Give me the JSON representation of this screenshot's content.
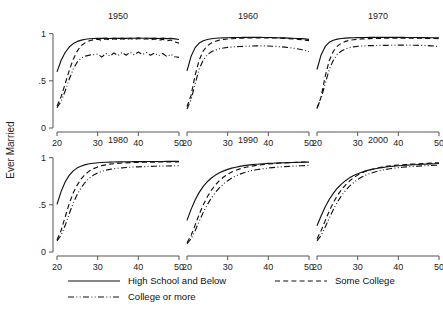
{
  "chart_data": {
    "type": "line",
    "title": "",
    "xlabel": "",
    "ylabel": "Ever Married",
    "xlim": [
      20,
      50
    ],
    "ylim": [
      0,
      1.06
    ],
    "xticks": [
      20,
      30,
      40,
      50
    ],
    "xtick_labels": [
      "20",
      "30",
      "40",
      "50"
    ],
    "yticks": [
      0,
      0.5,
      1
    ],
    "ytick_labels": [
      "0",
      ".5",
      "1"
    ],
    "grid": false,
    "legend_position": "bottom",
    "layout": "2 rows x 3 columns small multiples",
    "panel_titles": [
      "1950",
      "1960",
      "1970",
      "1980",
      "1990",
      "2000"
    ],
    "series_names": [
      "High School and Below",
      "Some College",
      "College or more"
    ],
    "series_styles": [
      "solid",
      "dashed",
      "dash-dot-dot"
    ],
    "x": [
      20,
      21,
      22,
      23,
      24,
      25,
      26,
      27,
      28,
      29,
      30,
      31,
      32,
      33,
      34,
      35,
      36,
      37,
      38,
      39,
      40,
      41,
      42,
      43,
      44,
      45,
      46,
      47,
      48,
      49,
      50
    ],
    "panels": [
      {
        "title": "1950",
        "series": [
          {
            "name": "High School and Below",
            "style": "solid",
            "values": [
              0.595,
              0.715,
              0.8,
              0.858,
              0.895,
              0.918,
              0.932,
              0.941,
              0.946,
              0.949,
              0.951,
              0.95,
              0.952,
              0.949,
              0.952,
              0.95,
              0.953,
              0.95,
              0.954,
              0.951,
              0.955,
              0.951,
              0.954,
              0.95,
              0.953,
              0.949,
              0.952,
              0.948,
              0.95,
              0.944,
              0.938
            ]
          },
          {
            "name": "Some College",
            "style": "dashed",
            "values": [
              0.232,
              0.33,
              0.468,
              0.608,
              0.73,
              0.818,
              0.874,
              0.906,
              0.925,
              0.936,
              0.941,
              0.93,
              0.944,
              0.933,
              0.946,
              0.934,
              0.947,
              0.936,
              0.949,
              0.938,
              0.95,
              0.938,
              0.946,
              0.934,
              0.944,
              0.93,
              0.94,
              0.924,
              0.932,
              0.912,
              0.9
            ]
          },
          {
            "name": "College or more",
            "style": "dash-dot-dot",
            "values": [
              0.215,
              0.283,
              0.392,
              0.516,
              0.626,
              0.7,
              0.742,
              0.762,
              0.773,
              0.778,
              0.783,
              0.752,
              0.79,
              0.762,
              0.795,
              0.768,
              0.8,
              0.772,
              0.803,
              0.776,
              0.805,
              0.778,
              0.8,
              0.772,
              0.796,
              0.766,
              0.79,
              0.758,
              0.782,
              0.755,
              0.748
            ]
          }
        ]
      },
      {
        "title": "1960",
        "series": [
          {
            "name": "High School and Below",
            "style": "solid",
            "values": [
              0.605,
              0.76,
              0.852,
              0.9,
              0.925,
              0.938,
              0.946,
              0.951,
              0.954,
              0.956,
              0.957,
              0.958,
              0.959,
              0.959,
              0.96,
              0.96,
              0.96,
              0.96,
              0.96,
              0.959,
              0.959,
              0.958,
              0.957,
              0.956,
              0.955,
              0.953,
              0.951,
              0.949,
              0.947,
              0.944,
              0.94
            ]
          },
          {
            "name": "Some College",
            "style": "dashed",
            "values": [
              0.225,
              0.345,
              0.56,
              0.72,
              0.818,
              0.872,
              0.902,
              0.92,
              0.931,
              0.938,
              0.943,
              0.946,
              0.949,
              0.951,
              0.953,
              0.954,
              0.955,
              0.956,
              0.956,
              0.956,
              0.956,
              0.955,
              0.954,
              0.952,
              0.95,
              0.948,
              0.945,
              0.941,
              0.937,
              0.932,
              0.926
            ]
          },
          {
            "name": "College or more",
            "style": "dash-dot-dot",
            "values": [
              0.2,
              0.3,
              0.47,
              0.625,
              0.72,
              0.776,
              0.808,
              0.827,
              0.84,
              0.848,
              0.854,
              0.858,
              0.862,
              0.864,
              0.866,
              0.868,
              0.869,
              0.87,
              0.87,
              0.87,
              0.869,
              0.867,
              0.865,
              0.862,
              0.858,
              0.853,
              0.847,
              0.84,
              0.832,
              0.822,
              0.81
            ]
          }
        ]
      },
      {
        "title": "1970",
        "series": [
          {
            "name": "High School and Below",
            "style": "solid",
            "values": [
              0.62,
              0.775,
              0.862,
              0.908,
              0.93,
              0.942,
              0.949,
              0.953,
              0.956,
              0.957,
              0.958,
              0.959,
              0.959,
              0.96,
              0.96,
              0.96,
              0.96,
              0.96,
              0.96,
              0.96,
              0.96,
              0.96,
              0.959,
              0.959,
              0.959,
              0.958,
              0.958,
              0.958,
              0.957,
              0.957,
              0.956
            ]
          },
          {
            "name": "Some College",
            "style": "dashed",
            "values": [
              0.205,
              0.33,
              0.545,
              0.712,
              0.812,
              0.868,
              0.9,
              0.918,
              0.929,
              0.936,
              0.941,
              0.944,
              0.946,
              0.948,
              0.949,
              0.95,
              0.951,
              0.951,
              0.951,
              0.952,
              0.952,
              0.952,
              0.952,
              0.952,
              0.951,
              0.951,
              0.951,
              0.95,
              0.95,
              0.949,
              0.948
            ]
          },
          {
            "name": "College or more",
            "style": "dash-dot-dot",
            "values": [
              0.215,
              0.31,
              0.47,
              0.618,
              0.718,
              0.78,
              0.816,
              0.838,
              0.852,
              0.86,
              0.866,
              0.869,
              0.872,
              0.873,
              0.874,
              0.875,
              0.876,
              0.876,
              0.877,
              0.877,
              0.878,
              0.878,
              0.878,
              0.878,
              0.877,
              0.876,
              0.875,
              0.873,
              0.871,
              0.868,
              0.864
            ]
          }
        ]
      },
      {
        "title": "1980",
        "series": [
          {
            "name": "High School and Below",
            "style": "solid",
            "values": [
              0.505,
              0.64,
              0.742,
              0.812,
              0.86,
              0.892,
              0.912,
              0.926,
              0.935,
              0.941,
              0.946,
              0.949,
              0.951,
              0.953,
              0.954,
              0.955,
              0.956,
              0.957,
              0.957,
              0.958,
              0.958,
              0.958,
              0.959,
              0.959,
              0.959,
              0.959,
              0.959,
              0.96,
              0.96,
              0.96,
              0.96
            ]
          },
          {
            "name": "Some College",
            "style": "dashed",
            "values": [
              0.128,
              0.228,
              0.37,
              0.512,
              0.628,
              0.712,
              0.778,
              0.826,
              0.86,
              0.884,
              0.902,
              0.915,
              0.924,
              0.931,
              0.936,
              0.94,
              0.943,
              0.945,
              0.947,
              0.949,
              0.95,
              0.951,
              0.952,
              0.953,
              0.953,
              0.954,
              0.954,
              0.955,
              0.955,
              0.955,
              0.956
            ]
          },
          {
            "name": "College or more",
            "style": "dash-dot-dot",
            "values": [
              0.118,
              0.178,
              0.28,
              0.405,
              0.52,
              0.612,
              0.686,
              0.742,
              0.784,
              0.815,
              0.838,
              0.855,
              0.867,
              0.876,
              0.883,
              0.888,
              0.892,
              0.896,
              0.899,
              0.901,
              0.903,
              0.905,
              0.906,
              0.908,
              0.909,
              0.91,
              0.911,
              0.912,
              0.913,
              0.914,
              0.915
            ]
          }
        ]
      },
      {
        "title": "1990",
        "series": [
          {
            "name": "High School and Below",
            "style": "solid",
            "values": [
              0.335,
              0.452,
              0.552,
              0.632,
              0.695,
              0.745,
              0.784,
              0.815,
              0.84,
              0.86,
              0.876,
              0.889,
              0.899,
              0.908,
              0.915,
              0.921,
              0.926,
              0.93,
              0.933,
              0.936,
              0.939,
              0.941,
              0.943,
              0.945,
              0.946,
              0.948,
              0.949,
              0.95,
              0.951,
              0.952,
              0.953
            ]
          },
          {
            "name": "Some College",
            "style": "dashed",
            "values": [
              0.098,
              0.175,
              0.285,
              0.4,
              0.5,
              0.585,
              0.655,
              0.712,
              0.758,
              0.795,
              0.824,
              0.847,
              0.866,
              0.881,
              0.893,
              0.903,
              0.911,
              0.918,
              0.924,
              0.929,
              0.933,
              0.937,
              0.94,
              0.943,
              0.945,
              0.947,
              0.949,
              0.951,
              0.952,
              0.954,
              0.955
            ]
          },
          {
            "name": "College or more",
            "style": "dash-dot-dot",
            "values": [
              0.085,
              0.14,
              0.225,
              0.325,
              0.42,
              0.502,
              0.572,
              0.632,
              0.682,
              0.722,
              0.756,
              0.784,
              0.806,
              0.825,
              0.84,
              0.853,
              0.863,
              0.872,
              0.879,
              0.885,
              0.89,
              0.895,
              0.899,
              0.902,
              0.905,
              0.908,
              0.91,
              0.912,
              0.914,
              0.916,
              0.918
            ]
          }
        ]
      },
      {
        "title": "2000",
        "series": [
          {
            "name": "High School and Below",
            "style": "solid",
            "values": [
              0.278,
              0.382,
              0.476,
              0.556,
              0.622,
              0.676,
              0.72,
              0.756,
              0.786,
              0.81,
              0.83,
              0.846,
              0.86,
              0.871,
              0.88,
              0.888,
              0.895,
              0.901,
              0.906,
              0.91,
              0.914,
              0.917,
              0.92,
              0.923,
              0.925,
              0.928,
              0.93,
              0.932,
              0.934,
              0.936,
              0.938
            ]
          },
          {
            "name": "Some College",
            "style": "dashed",
            "values": [
              0.14,
              0.226,
              0.33,
              0.432,
              0.522,
              0.598,
              0.66,
              0.71,
              0.752,
              0.787,
              0.815,
              0.838,
              0.856,
              0.871,
              0.883,
              0.893,
              0.901,
              0.908,
              0.913,
              0.918,
              0.922,
              0.925,
              0.928,
              0.931,
              0.933,
              0.936,
              0.938,
              0.94,
              0.942,
              0.944,
              0.946
            ]
          },
          {
            "name": "College or more",
            "style": "dash-dot-dot",
            "values": [
              0.118,
              0.175,
              0.262,
              0.358,
              0.448,
              0.528,
              0.596,
              0.652,
              0.698,
              0.736,
              0.768,
              0.794,
              0.815,
              0.832,
              0.846,
              0.858,
              0.868,
              0.876,
              0.883,
              0.889,
              0.894,
              0.898,
              0.902,
              0.905,
              0.908,
              0.911,
              0.913,
              0.915,
              0.917,
              0.919,
              0.921
            ]
          }
        ]
      }
    ]
  },
  "legend": {
    "entries": [
      {
        "label": "High School and Below",
        "style": "solid"
      },
      {
        "label": "Some College",
        "style": "dashed"
      },
      {
        "label": "College or more",
        "style": "dash-dot-dot"
      }
    ]
  }
}
